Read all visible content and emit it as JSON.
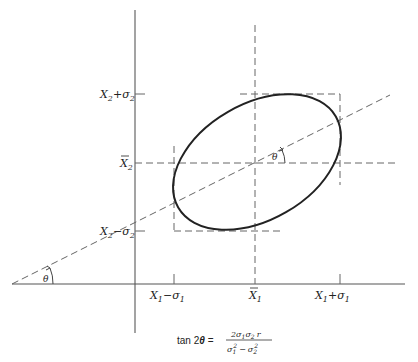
{
  "diagram": {
    "axes": {
      "y_ticks": [
        {
          "id": "x2_plus_sigma2",
          "base": "X",
          "sub": "2",
          "op": "+",
          "sym": "σ",
          "sym_sub": "2"
        },
        {
          "id": "x2_bar",
          "base": "X",
          "sub": "2",
          "bar": true
        },
        {
          "id": "x2_minus_sigma2",
          "base": "X",
          "sub": "2",
          "op": "−",
          "sym": "σ",
          "sym_sub": "2"
        }
      ],
      "x_ticks": [
        {
          "id": "x1_minus_sigma1",
          "base": "X",
          "sub": "1",
          "op": "−",
          "sym": "σ",
          "sym_sub": "1"
        },
        {
          "id": "x1_bar",
          "base": "X",
          "sub": "1",
          "bar": true
        },
        {
          "id": "x1_plus_sigma1",
          "base": "X",
          "sub": "1",
          "op": "+",
          "sym": "σ",
          "sym_sub": "1"
        }
      ]
    },
    "labels": {
      "x2": "X",
      "x1": "X",
      "sub1": "1",
      "sub2": "2",
      "plus": "+",
      "minus": "−",
      "sigma": "σ",
      "theta_center": "θ",
      "theta_origin": "θ"
    },
    "formula": {
      "lhs": "tan 2",
      "theta": "θ",
      "equals": "=",
      "numerator": "2σ",
      "num_sub1": "1",
      "num_sigma2": "σ",
      "num_sub2": "2",
      "num_r": "r",
      "den_sigma1": "σ",
      "den_sub1": "1",
      "den_sup1": "2",
      "den_minus": "−",
      "den_sigma2": "σ",
      "den_sub2": "2",
      "den_sup2": "2"
    },
    "colors": {
      "line": "#333333",
      "dash": "#555555",
      "axis": "#555555"
    }
  }
}
